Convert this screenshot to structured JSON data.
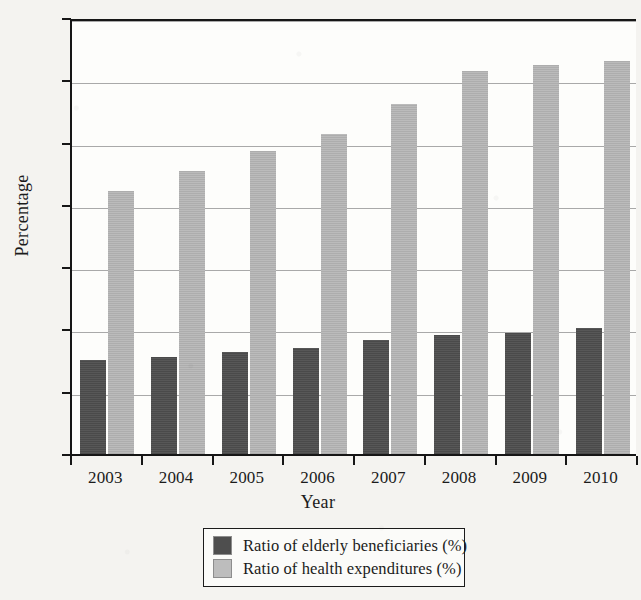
{
  "chart_data": {
    "type": "bar",
    "title": "",
    "xlabel": "Year",
    "ylabel": "Percentage",
    "categories": [
      "2003",
      "2004",
      "2005",
      "2006",
      "2007",
      "2008",
      "2009",
      "2010"
    ],
    "series": [
      {
        "name": "Ratio of elderly beneficiaries (%)",
        "color": "#4e4e4e",
        "values": [
          7.6,
          7.9,
          8.3,
          8.6,
          9.2,
          9.6,
          9.8,
          10.2
        ]
      },
      {
        "name": "Ratio of health expenditures (%)",
        "color": "#b6b6b6",
        "values": [
          21.2,
          22.8,
          24.4,
          25.8,
          28.2,
          30.8,
          31.3,
          31.6
        ]
      }
    ],
    "ylim": [
      0,
      35
    ],
    "yticks": [
      0,
      5,
      10,
      15,
      20,
      25,
      30,
      35
    ],
    "ytick_labels": [
      "0",
      "5",
      "10",
      "15",
      "20",
      "25",
      "30",
      "35"
    ],
    "grid": true,
    "grid_axis": "y",
    "legend_position": "bottom-center"
  },
  "legend": {
    "entries": [
      {
        "label": "Ratio of elderly beneficiaries (%)",
        "swatch": "dark"
      },
      {
        "label": "Ratio of health expenditures (%)",
        "swatch": "light"
      }
    ]
  },
  "axes": {
    "y_title": "Percentage",
    "x_title": "Year"
  }
}
